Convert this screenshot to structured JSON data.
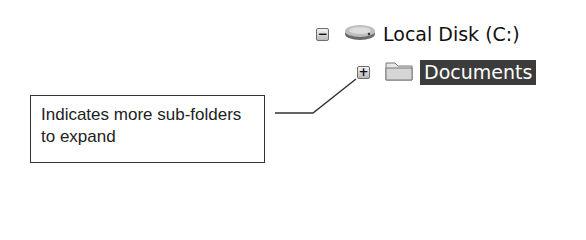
{
  "tree": {
    "items": [
      {
        "label": "Local Disk (C:)",
        "expander": "−",
        "icon": "hard-drive-icon",
        "state": "expanded",
        "selected": false
      },
      {
        "label": "Documents",
        "expander": "+",
        "icon": "folder-icon",
        "state": "collapsed",
        "selected": true
      }
    ]
  },
  "callout": {
    "text": "Indicates more sub-folders to expand"
  },
  "colors": {
    "selection_bg": "#3c3c3c",
    "selection_text": "#ffffff",
    "line": "#333333"
  }
}
